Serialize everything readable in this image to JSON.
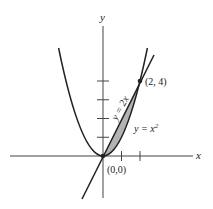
{
  "figure": {
    "type": "region-between-curves",
    "axes": {
      "x_label": "x",
      "y_label": "y"
    },
    "curves": [
      {
        "name": "parabola",
        "equation": "y = x",
        "superscript": "2"
      },
      {
        "name": "line",
        "equation": "y = 2x"
      }
    ],
    "points": [
      {
        "label": "(0,0)"
      },
      {
        "label": "(2, 4)"
      }
    ],
    "x_ticks": [
      1,
      2
    ],
    "y_ticks": [
      1,
      2,
      3,
      4
    ],
    "shaded_region": "between y = 2x and y = x^2 from x = 0 to x = 2",
    "colors": {
      "stroke": "#222222",
      "shade": "#b3b3b3",
      "axis": "#444444"
    }
  }
}
